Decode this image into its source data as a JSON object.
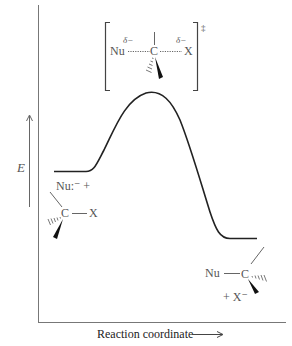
{
  "diagram": {
    "type": "reaction-energy-profile",
    "axes": {
      "y_label": "E",
      "x_label": "Reaction coordinate",
      "x_arrow": "⟶"
    },
    "transition_state": {
      "nu": "Nu",
      "delta_nu": "δ−",
      "c": "C",
      "delta_x": "δ−",
      "x": "X",
      "symbol": "‡"
    },
    "reactants": {
      "nucleophile": "Nu:⁻ +",
      "c": "C",
      "x": "X"
    },
    "products": {
      "nu": "Nu",
      "c": "C",
      "leaving_group": "+ X⁻"
    },
    "curve": {
      "reactant_level_y": 171,
      "peak_y": 93,
      "product_level_y": 238,
      "color": "#222222"
    }
  }
}
